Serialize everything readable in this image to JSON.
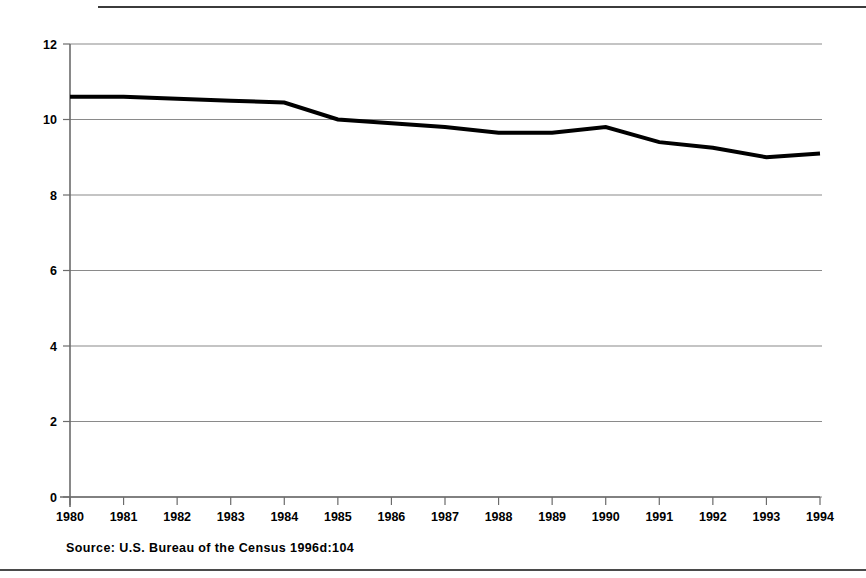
{
  "figure": {
    "source_note": "Source: U.S. Bureau of the Census 1996d:104"
  },
  "chart_data": {
    "type": "line",
    "title": "",
    "subtitle": "",
    "xlabel": "",
    "ylabel": "",
    "x": [
      1980,
      1981,
      1982,
      1983,
      1984,
      1985,
      1986,
      1987,
      1988,
      1989,
      1990,
      1991,
      1992,
      1993,
      1994
    ],
    "values": [
      10.6,
      10.6,
      10.55,
      10.5,
      10.45,
      10.0,
      9.9,
      9.8,
      9.65,
      9.65,
      9.8,
      9.4,
      9.25,
      9.0,
      9.1
    ],
    "series": [
      {
        "name": "rate",
        "values": [
          10.6,
          10.6,
          10.55,
          10.5,
          10.45,
          10.0,
          9.9,
          9.8,
          9.65,
          9.65,
          9.8,
          9.4,
          9.25,
          9.0,
          9.1
        ]
      }
    ],
    "xtick_labels": [
      "1980",
      "1981",
      "1982",
      "1983",
      "1984",
      "1985",
      "1986",
      "1987",
      "1988",
      "1989",
      "1990",
      "1991",
      "1992",
      "1993",
      "1994"
    ],
    "ytick_labels": [
      "0",
      "2",
      "4",
      "6",
      "8",
      "10",
      "12"
    ],
    "yticks": [
      0,
      2,
      4,
      6,
      8,
      10,
      12
    ],
    "ylim": [
      0,
      12
    ],
    "xlim": [
      1980,
      1994
    ],
    "grid": "horizontal",
    "legend": "none",
    "colors": {
      "line": "#000000",
      "grid": "#8a8a8a",
      "axis": "#6b6b6b",
      "text": "#000000",
      "background": "#ffffff"
    },
    "line_width_px": 4,
    "annotations": []
  }
}
